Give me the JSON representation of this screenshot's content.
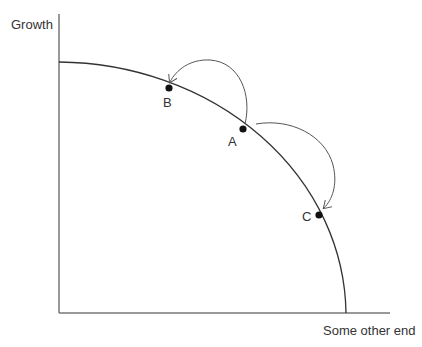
{
  "diagram": {
    "type": "production-possibility-frontier",
    "y_axis_label": "Growth",
    "x_axis_label": "Some other end",
    "points": [
      {
        "id": "A",
        "label": "A"
      },
      {
        "id": "B",
        "label": "B"
      },
      {
        "id": "C",
        "label": "C"
      }
    ],
    "arrows": [
      {
        "from": "A",
        "to": "B"
      },
      {
        "from": "A",
        "to": "C"
      }
    ],
    "colors": {
      "axis": "#666666",
      "curve": "#333333",
      "arrow": "#555555",
      "point": "#111111"
    }
  }
}
